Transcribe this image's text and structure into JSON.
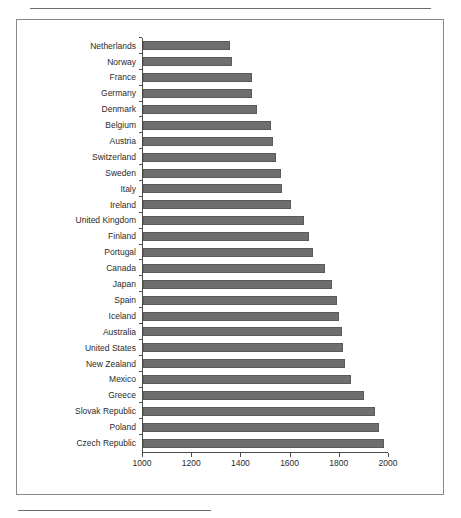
{
  "figure": {
    "frame_border_color": "#8a8a8a",
    "bar_color": "#6e6e6e",
    "axis_color": "#4c4c4c",
    "rule_color": "#6d6d6d"
  },
  "chart_data": {
    "type": "bar",
    "orientation": "horizontal",
    "title": "",
    "subtitle": "",
    "xlabel": "",
    "ylabel": "",
    "xlim": [
      1000,
      2000
    ],
    "xticks": [
      1000,
      1200,
      1400,
      1600,
      1800,
      2000
    ],
    "xtick_labels": [
      "1000",
      "1200",
      "1400",
      "1600",
      "1800",
      "2000"
    ],
    "grid": false,
    "legend": null,
    "categories": [
      "Netherlands",
      "Norway",
      "France",
      "Germany",
      "Denmark",
      "Belgium",
      "Austria",
      "Switzerland",
      "Sweden",
      "Italy",
      "Ireland",
      "United Kingdom",
      "Finland",
      "Portugal",
      "Canada",
      "Japan",
      "Spain",
      "Iceland",
      "Australia",
      "United States",
      "New Zealand",
      "Mexico",
      "Greece",
      "Slovak Republic",
      "Poland",
      "Czech Republic"
    ],
    "values": [
      1355,
      1360,
      1445,
      1445,
      1465,
      1520,
      1530,
      1540,
      1560,
      1565,
      1600,
      1655,
      1675,
      1690,
      1740,
      1770,
      1790,
      1795,
      1810,
      1815,
      1820,
      1845,
      1900,
      1945,
      1960,
      1980
    ]
  }
}
